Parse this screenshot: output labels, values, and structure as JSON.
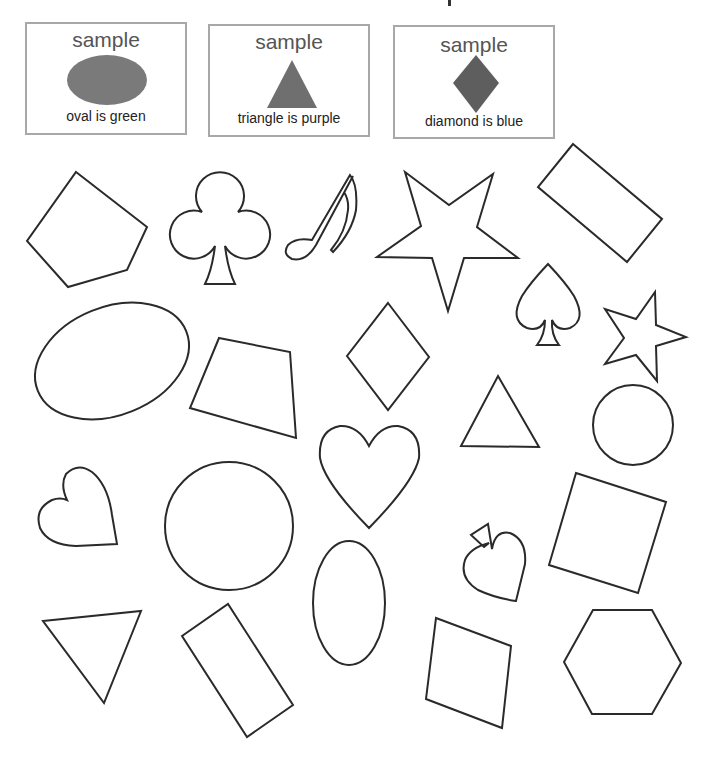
{
  "worksheet": {
    "samples": [
      {
        "title": "sample",
        "shape": "oval",
        "caption": "oval is green",
        "fill": "#7a7a7a"
      },
      {
        "title": "sample",
        "shape": "triangle",
        "caption": "triangle is purple",
        "fill": "#6f6f6f"
      },
      {
        "title": "sample",
        "shape": "diamond",
        "caption": "diamond is blue",
        "fill": "#5e5e5e"
      }
    ],
    "shapes": [
      "pentagon",
      "club",
      "music-note",
      "star",
      "rectangle",
      "spade",
      "star",
      "oval",
      "trapezoid",
      "diamond",
      "triangle",
      "circle",
      "heart",
      "heart",
      "circle",
      "spade",
      "square",
      "triangle",
      "rectangle",
      "oval",
      "square",
      "hexagon"
    ],
    "colors": {
      "outline": "#2a2a2a",
      "box_border": "#a8a8a8"
    }
  }
}
